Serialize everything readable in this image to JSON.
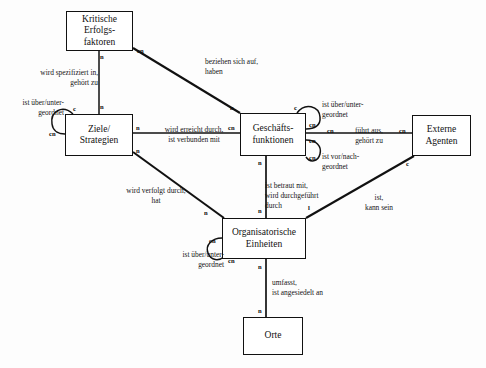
{
  "diagram": {
    "type": "entity-relationship-diagram",
    "background_color": "#fdfdfd",
    "line_color": "#111111",
    "entities": [
      {
        "id": "kef",
        "label": "Kritische\nErfolgs-\nfaktoren",
        "x": 66,
        "y": 11,
        "w": 67,
        "h": 40
      },
      {
        "id": "ziel",
        "label": "Ziele/\nStrategien",
        "x": 65,
        "y": 114,
        "w": 68,
        "h": 42
      },
      {
        "id": "gf",
        "label": "Geschäfts-\nfunktionen",
        "x": 240,
        "y": 113,
        "w": 66,
        "h": 43
      },
      {
        "id": "ea",
        "label": "Externe\nAgenten",
        "x": 412,
        "y": 115,
        "w": 59,
        "h": 41
      },
      {
        "id": "oe",
        "label": "Organisatorische\nEinheiten",
        "x": 222,
        "y": 218,
        "w": 84,
        "h": 41
      },
      {
        "id": "orte",
        "label": "Orte",
        "x": 243,
        "y": 317,
        "w": 60,
        "h": 38
      }
    ],
    "relationship_labels": [
      {
        "id": "r1",
        "text": "wird spezifiziert in,\ngehört zu",
        "x": 16,
        "y": 68,
        "w": 82,
        "align": "right"
      },
      {
        "id": "r2",
        "text": "beziehen sich auf,\nhaben",
        "x": 205,
        "y": 57,
        "w": 84,
        "align": "left"
      },
      {
        "id": "r3",
        "text": "ist über/unter-\ngeordnet",
        "x": 2,
        "y": 98,
        "w": 62,
        "align": "right"
      },
      {
        "id": "r4",
        "text": "wird erreicht durch,\nist verbunden mit",
        "x": 148,
        "y": 125,
        "w": 92,
        "align": "center"
      },
      {
        "id": "r5",
        "text": "ist über/unter-\ngeordnet",
        "x": 322,
        "y": 100,
        "w": 60,
        "align": "left"
      },
      {
        "id": "r6",
        "text": "führt aus,\ngehört zu",
        "x": 340,
        "y": 126,
        "w": 58,
        "align": "center"
      },
      {
        "id": "r7",
        "text": "ist vor/nach-\ngeordnet",
        "x": 320,
        "y": 152,
        "w": 58,
        "align": "left"
      },
      {
        "id": "r8",
        "text": "wird verfolgt durch,\nhat",
        "x": 110,
        "y": 186,
        "w": 92,
        "align": "center"
      },
      {
        "id": "r9",
        "text": "ist betraut mit,\nwird durchgeführt\ndurch",
        "x": 265,
        "y": 181,
        "w": 66,
        "align": "left"
      },
      {
        "id": "r10",
        "text": "ist,\nkann sein",
        "x": 356,
        "y": 193,
        "w": 46,
        "align": "center"
      },
      {
        "id": "r11",
        "text": "ist über/unter-\ngeordnet",
        "x": 162,
        "y": 250,
        "w": 62,
        "align": "right"
      },
      {
        "id": "r12",
        "text": "umfasst,\nist angesiedelt an",
        "x": 272,
        "y": 278,
        "w": 78,
        "align": "left"
      }
    ],
    "cardinalities": [
      {
        "id": "c1",
        "text": "n",
        "x": 100,
        "y": 53
      },
      {
        "id": "c2",
        "text": "cn",
        "x": 137,
        "y": 48
      },
      {
        "id": "c3",
        "text": "n",
        "x": 100,
        "y": 104
      },
      {
        "id": "c4",
        "text": "c",
        "x": 73,
        "y": 107
      },
      {
        "id": "c5",
        "text": "cn",
        "x": 51,
        "y": 131
      },
      {
        "id": "c6",
        "text": "n",
        "x": 136,
        "y": 124
      },
      {
        "id": "c7",
        "text": "n",
        "x": 136,
        "y": 148
      },
      {
        "id": "c8",
        "text": "n",
        "x": 231,
        "y": 105
      },
      {
        "id": "c9",
        "text": "cn",
        "x": 229,
        "y": 124
      },
      {
        "id": "c10",
        "text": "c",
        "x": 294,
        "y": 106
      },
      {
        "id": "c11",
        "text": "cn",
        "x": 309,
        "y": 122
      },
      {
        "id": "c12",
        "text": "cn",
        "x": 309,
        "y": 138
      },
      {
        "id": "c13",
        "text": "cn",
        "x": 327,
        "y": 126
      },
      {
        "id": "c14",
        "text": "cn",
        "x": 399,
        "y": 126
      },
      {
        "id": "c15",
        "text": "cn",
        "x": 309,
        "y": 155
      },
      {
        "id": "c16",
        "text": "n",
        "x": 258,
        "y": 160
      },
      {
        "id": "c17",
        "text": "n",
        "x": 258,
        "y": 207
      },
      {
        "id": "c18",
        "text": "n",
        "x": 205,
        "y": 210
      },
      {
        "id": "c19",
        "text": "l",
        "x": 308,
        "y": 205
      },
      {
        "id": "c20",
        "text": "c",
        "x": 407,
        "y": 161
      },
      {
        "id": "c21",
        "text": "cn",
        "x": 210,
        "y": 238
      },
      {
        "id": "c22",
        "text": "cn",
        "x": 228,
        "y": 258
      },
      {
        "id": "c23",
        "text": "n",
        "x": 258,
        "y": 264
      },
      {
        "id": "c24",
        "text": "n",
        "x": 258,
        "y": 308
      }
    ]
  }
}
